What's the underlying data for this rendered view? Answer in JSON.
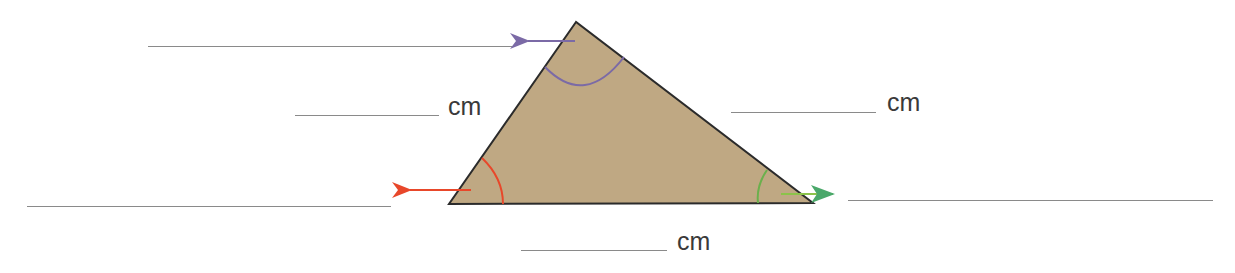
{
  "worksheet": {
    "triangle": {
      "fill_color": "#bfa883",
      "stroke_color": "#2b2b2b",
      "vertices": {
        "top": [
          576,
          22
        ],
        "bottom_left": [
          449,
          204
        ],
        "bottom_right": [
          813,
          203
        ]
      }
    },
    "angles": [
      {
        "name": "top-angle",
        "color": "#7b6aa6",
        "arrow_direction": "left"
      },
      {
        "name": "bottom-left-angle",
        "color": "#e8472a",
        "arrow_direction": "left"
      },
      {
        "name": "bottom-right-angle",
        "color": "#6ab04c",
        "arrow_direction": "right"
      }
    ],
    "side_blanks": [
      {
        "name": "left-side",
        "unit": "cm"
      },
      {
        "name": "right-side",
        "unit": "cm"
      },
      {
        "name": "bottom-side",
        "unit": "cm"
      }
    ],
    "angle_blanks": [
      {
        "name": "top-angle-answer"
      },
      {
        "name": "bottom-left-angle-answer"
      },
      {
        "name": "bottom-right-angle-answer"
      }
    ]
  }
}
